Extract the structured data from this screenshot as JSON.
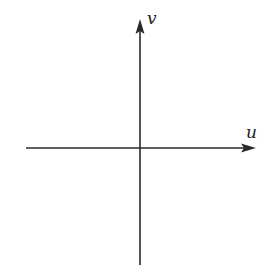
{
  "diagram": {
    "type": "coordinate-axes",
    "axes": {
      "horizontal": {
        "label": "u",
        "direction": "right",
        "arrow": true
      },
      "vertical": {
        "label": "v",
        "direction": "up",
        "arrow": true
      }
    },
    "colors": {
      "axis": "#2a2a2a",
      "background": "#ffffff"
    }
  }
}
